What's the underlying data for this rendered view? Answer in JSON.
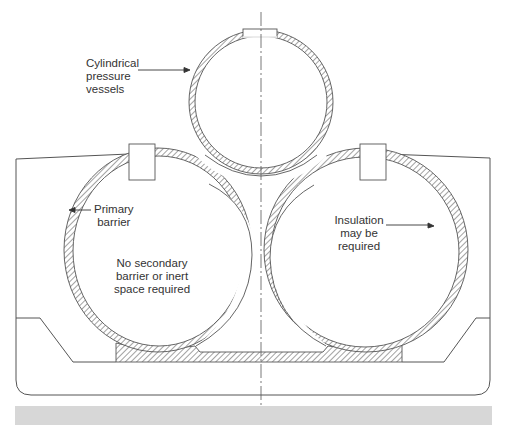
{
  "figure": {
    "type": "cross-section diagram",
    "colors": {
      "line": "#444444",
      "hatch": "#555555",
      "background": "#ffffff",
      "footer_strip": "#d7d7d7"
    }
  },
  "labels": {
    "cylindrical_pressure_vessels": [
      "Cylindrical",
      "pressure",
      "vessels"
    ],
    "primary_barrier": [
      "Primary",
      "barrier"
    ],
    "no_secondary_barrier": [
      "No secondary",
      "barrier or inert",
      "space required"
    ],
    "insulation": [
      "Insulation",
      "may be",
      "required"
    ]
  },
  "components": {
    "tanks": [
      {
        "name": "upper-cylinder",
        "position": "top-center"
      },
      {
        "name": "lower-left-cylinder",
        "position": "bottom-left"
      },
      {
        "name": "lower-right-cylinder",
        "position": "bottom-right"
      }
    ],
    "features": [
      "tank domes",
      "hull outline",
      "inner bottom with hopper",
      "saddle supports (hatched)",
      "centerline"
    ]
  }
}
